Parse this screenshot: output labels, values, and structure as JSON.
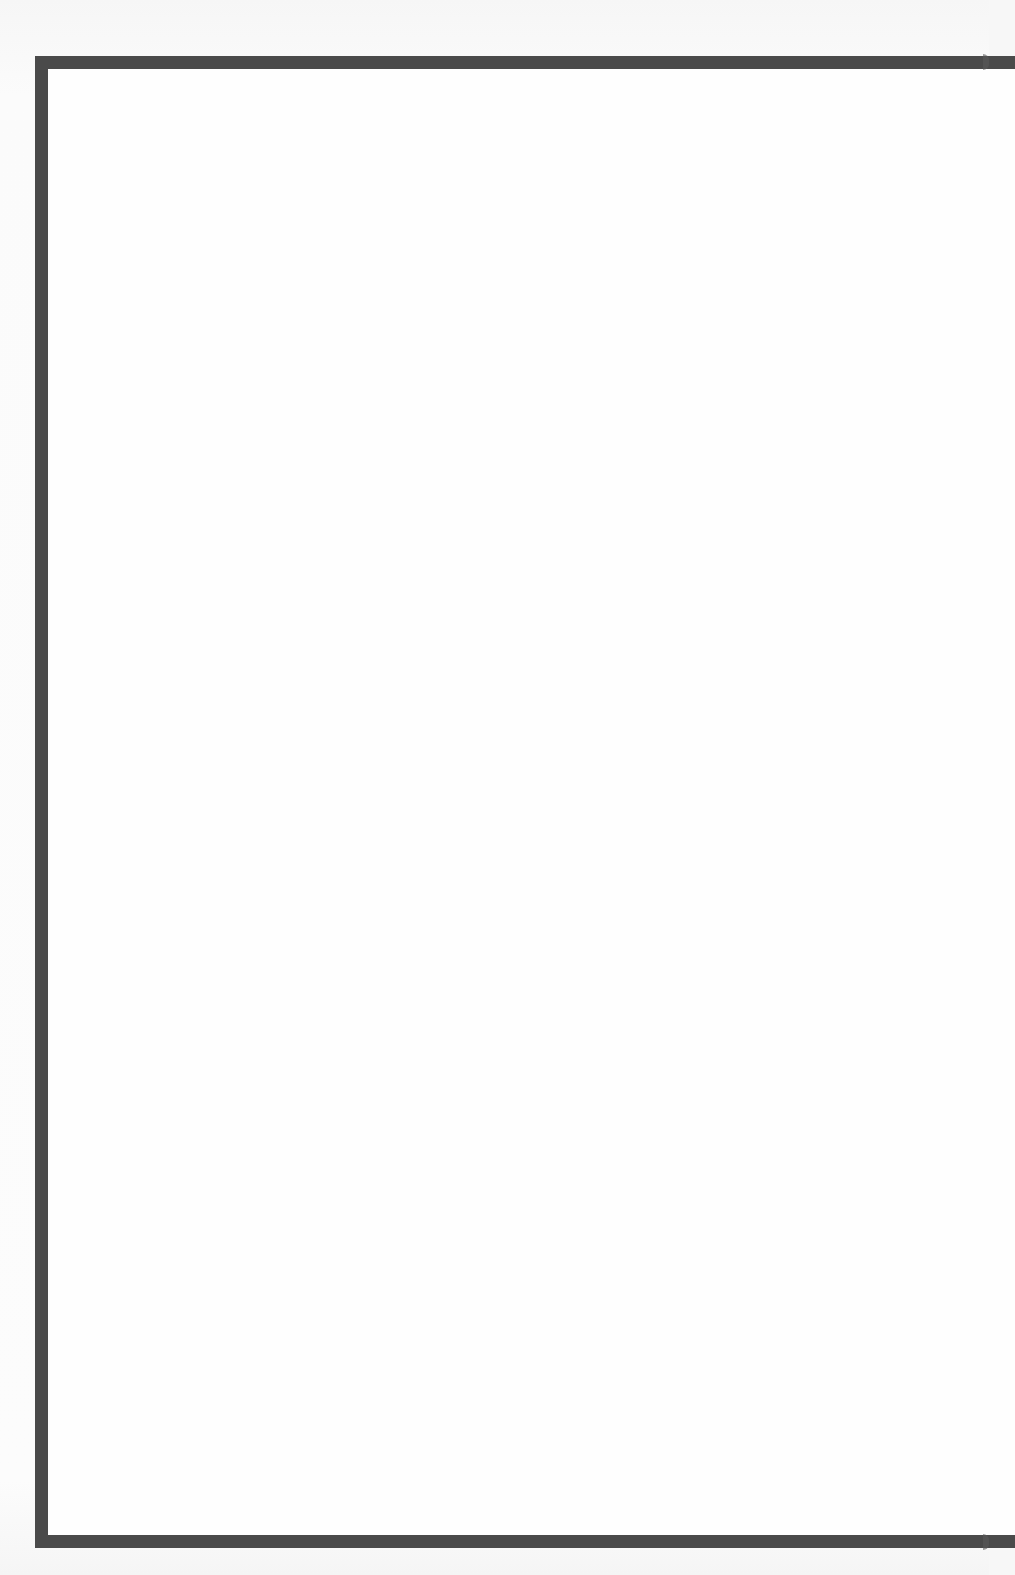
{
  "page": {
    "type": "blank-bordered-page",
    "background_color": "#f7f7f7",
    "content_text": ""
  },
  "frame": {
    "border_color": "#4a4a4a",
    "border_width_px": 13,
    "sides_visible": [
      "top",
      "left",
      "bottom"
    ],
    "interior_color": "#fefefe"
  }
}
